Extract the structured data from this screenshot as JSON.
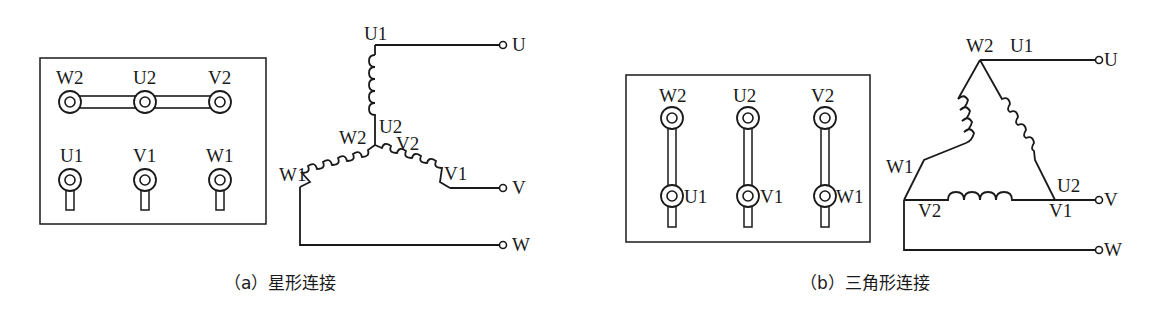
{
  "figure": {
    "panel_a": {
      "caption": "（a）星形连接",
      "terminal_box": {
        "top_labels": [
          "W2",
          "U2",
          "V2"
        ],
        "bottom_labels": [
          "U1",
          "V1",
          "W1"
        ]
      },
      "schematic": {
        "labels": {
          "u1": "U1",
          "u2": "U2",
          "v2": "V2",
          "w2": "W2",
          "v1": "V1",
          "w1": "W1",
          "out_u": "U",
          "out_v": "V",
          "out_w": "W"
        }
      }
    },
    "panel_b": {
      "caption": "（b）三角形连接",
      "terminal_box": {
        "top_labels": [
          "W2",
          "U2",
          "V2"
        ],
        "bottom_labels": [
          "U1",
          "V1",
          "W1"
        ]
      },
      "schematic": {
        "labels": {
          "w2": "W2",
          "u1": "U1",
          "w1": "W1",
          "u2": "U2",
          "v2": "V2",
          "v1": "V1",
          "out_u": "U",
          "out_v": "V",
          "out_w": "W"
        }
      }
    },
    "colors": {
      "line": "#1a1a1a",
      "background": "#ffffff"
    }
  }
}
